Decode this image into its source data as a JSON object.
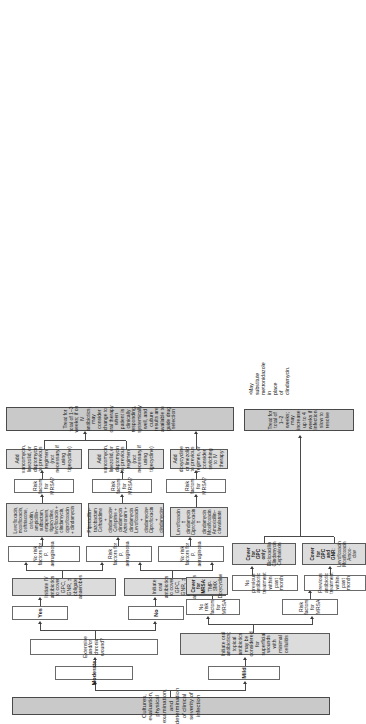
{
  "chart_title": "Clinical algorithm for the evaluation and antibiotic management of diabetic foot infection",
  "nodes": {
    "start": "Cultures, evaluation, physical examination, and determination of clinical severity of infection",
    "severity_mild": "Mild",
    "severity_moderate": "Moderate",
    "mild_initiate": "Initiate oral antibiotics; topical antibiotics may be considered for superficial wounds with minimal cellulitis",
    "mild_no_risk_mrsa": "No risk factors for MRSA",
    "mild_risk_mrsa": "Risk factors for MRSA",
    "mild_prev_abx": "Previous antibiotic treatment within past month",
    "mild_no_prev_abx": "No previous antibiotic treatment within past month",
    "mild_cover_gpc_gnr": "Cover for GPC and GNR:",
    "mild_cover_gpc_only": "Cover for GPC only:",
    "mild_cover_mrsa": "Cover for MRSA:",
    "mild_drugs_gpc_gnr": [
      "Levofloxacin",
      "Moxifloxacin",
      "Amox-clav"
    ],
    "mild_drugs_gpc_only": [
      "Dicloxacillin",
      "Clindamycin",
      "Cephalexin"
    ],
    "mild_drugs_mrsa": [
      "TMP-SMX",
      "Doxycycline"
    ],
    "mild_duration": "Treat for total of 1–2 weeks; may increase up to 4 weeks if infection slow to resolve",
    "mod_extensive_q": "Extensive and/or chronic wound?",
    "answer_no": "No",
    "answer_yes": "Yes",
    "mod_oral_initiate": "Initiate oral antibiotics to cover GPC, GNR, ± obligate anaerobes",
    "mod_iv_initiate": "Initiate IV antibiotics to cover GPC, GNR, ± obligate anaerobes",
    "no_risk_pa": "No risk factors for P. aeruginosa",
    "risk_pa": "Risk factors for P. aeruginosa",
    "oral_no_risk_drugs": [
      "Levofloxacin ± clindamycin",
      "Ciprofloxacin ± clindamycin",
      "Moxifloxacin",
      "Amoxicillin–clavulanate"
    ],
    "iv_risk_drugs": [
      "Piperacillin–tazobactam",
      "Ceftazidime + clindamycinᵃ",
      "Cefepime + clindamycin",
      "Aztreonam + clindamycin",
      "Levofloxacin + clindamycinᵃ",
      "Ciprofloxacin + clindamycinᵃ"
    ],
    "iv_no_risk_drugs": [
      "Levofloxacin, moxifloxacin,",
      "ceftriaxone, cefoxitin,",
      "ampicillin–sulbactam,",
      "ertapenem, tigacycline,",
      "levofloxacin + clindamycin,",
      "ciprofloxacin + clindamycin"
    ],
    "mrsa_q": "Risk factors for MRSA?",
    "mod_oral_mrsa_add": "Add doxycycline or linezolid to previous regimen, or consider switching to IV therapy",
    "mod_iv_mrsa_add": "Add vancomycin, linezolid, or daptomycin to previous regimen (not necessary if using tigecycline)",
    "mod_duration": "Treat for total of 1–3 weeks; if on IV antibiotics, may consider change to oral therapy when patient is clinically responding, systemically well, and culture results are available to guide drug selection"
  },
  "footnote": "ᵃMay substitute metronidazole in place of clindamycin."
}
